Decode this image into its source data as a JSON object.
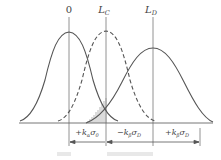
{
  "diagram": {
    "top_labels": [
      {
        "id": "origin",
        "text": "0",
        "x": 69
      },
      {
        "id": "lc",
        "base": "L",
        "sub": "C",
        "x": 106
      },
      {
        "id": "ld",
        "base": "L",
        "sub": "D",
        "x": 153
      }
    ],
    "curves": [
      {
        "name": "blank-distribution",
        "style": "solid",
        "center": 69,
        "peak_y": 32
      },
      {
        "name": "critical-level-distribution",
        "style": "dashed",
        "center": 106,
        "peak_y": 31
      },
      {
        "name": "detection-limit-distribution",
        "style": "solid",
        "center": 153,
        "peak_y": 48
      }
    ],
    "interval_labels": [
      {
        "sign": "+",
        "k": "k",
        "k_sub": "α",
        "sigma": "σ",
        "sigma_sub": "0",
        "x": 87
      },
      {
        "sign": "−",
        "k": "k",
        "k_sub": "β",
        "sigma": "σ",
        "sigma_sub": "D",
        "x": 129
      },
      {
        "sign": "+",
        "k": "k",
        "k_sub": "β",
        "sigma": "σ",
        "sigma_sub": "D",
        "x": 177
      }
    ],
    "hatched_region": {
      "description": "overlap area (β error)",
      "x_from": 86,
      "x_to": 106
    },
    "colors": {
      "line": "#555555",
      "hatch": "#888888",
      "caption": "#e6e6e6"
    }
  }
}
